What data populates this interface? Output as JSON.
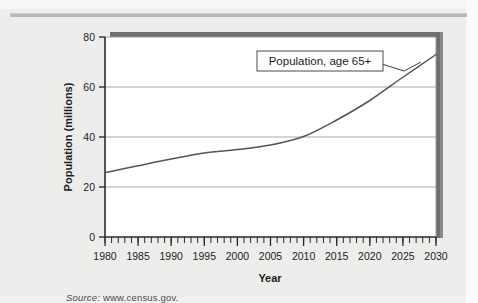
{
  "page": {
    "background_color": "#ededec",
    "rule_color": "#b9b9b9"
  },
  "source": {
    "label": "Source:",
    "value": "www.census.gov."
  },
  "chart_data": {
    "type": "line",
    "title": "",
    "xlabel": "Year",
    "ylabel": "Population (millions)",
    "xlim": [
      1980,
      2030
    ],
    "ylim": [
      0,
      80
    ],
    "yticks": [
      0,
      20,
      40,
      60,
      80
    ],
    "ytick_labels": [
      "0",
      "20",
      "40",
      "60",
      "80"
    ],
    "xticks": [
      1980,
      1985,
      1990,
      1995,
      2000,
      2005,
      2010,
      2015,
      2020,
      2025,
      2030
    ],
    "xtick_labels": [
      "1980",
      "1985",
      "1990",
      "1995",
      "2000",
      "2005",
      "2010",
      "2015",
      "2020",
      "2025",
      "2030"
    ],
    "minor_xtick_interval": 1,
    "grid": "horizontal",
    "legend_position": "none",
    "annotations": [
      {
        "text": "Population, age 65+",
        "box": true,
        "leader_line": true,
        "points_to_x": 2027,
        "points_to_y": 67
      }
    ],
    "series": [
      {
        "name": "Population, age 65+",
        "color": "#555555",
        "x": [
          1980,
          1985,
          1990,
          1995,
          2000,
          2005,
          2010,
          2015,
          2020,
          2025,
          2030
        ],
        "values": [
          25.7,
          28.5,
          31.2,
          33.6,
          35.0,
          36.8,
          40.2,
          46.8,
          54.6,
          63.9,
          73.0
        ]
      }
    ]
  },
  "axis": {
    "line_color": "#2b2b2b",
    "grid_color": "#a8a8a8"
  },
  "plot_shadow": {
    "color": "#6f6f6f"
  }
}
